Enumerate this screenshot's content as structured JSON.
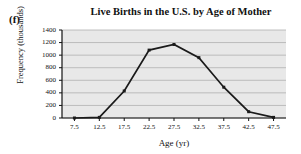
{
  "panel": {
    "label": "(f)"
  },
  "chart_data": {
    "type": "line",
    "title": "Live Births in the U.S. by Age of Mother",
    "xlabel": "Age (yr)",
    "ylabel": "Frequency (thousands)",
    "categories": [
      "7.5",
      "12.5",
      "17.5",
      "22.5",
      "27.5",
      "32.5",
      "37.5",
      "42.5",
      "47.5"
    ],
    "x": [
      7.5,
      12.5,
      17.5,
      22.5,
      27.5,
      32.5,
      37.5,
      42.5,
      47.5
    ],
    "values": [
      0,
      10,
      430,
      1080,
      1170,
      960,
      490,
      100,
      10
    ],
    "xticklabels": [
      "7.5",
      "12.5",
      "17.5",
      "22.5",
      "27.5",
      "32.5",
      "37.5",
      "42.5",
      "47.5"
    ],
    "yticklabels": [
      "0",
      "200",
      "400",
      "600",
      "800",
      "1000",
      "1200",
      "1400"
    ],
    "yticks": [
      0,
      200,
      400,
      600,
      800,
      1000,
      1200,
      1400
    ],
    "ylim": [
      0,
      1400
    ],
    "xlim": [
      5.0,
      50.0
    ],
    "grid": "horizontal",
    "legend": "none",
    "marker": "square",
    "line_color": "#1a1a1a",
    "plot_background": "#e8e8e8",
    "grid_color": "#a8a8a8"
  }
}
